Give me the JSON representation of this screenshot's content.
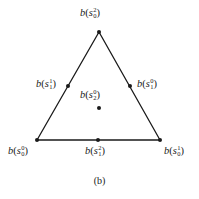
{
  "figure": {
    "caption": "(b)",
    "edge_color": "#1a1a1a",
    "vertices": {
      "top": {
        "x": 99,
        "y": 32
      },
      "bottom_left": {
        "x": 37,
        "y": 140
      },
      "bottom_right": {
        "x": 160,
        "y": 140
      }
    },
    "points": [
      {
        "id": "s0_2",
        "x": 99,
        "y": 32,
        "func": "b",
        "var": "s",
        "sup": "2",
        "sub": "0",
        "label_x": 80,
        "label_y": 8
      },
      {
        "id": "s1_1",
        "x": 68,
        "y": 86,
        "func": "b",
        "var": "s",
        "sup": "1",
        "sub": "1",
        "label_x": 36,
        "label_y": 79
      },
      {
        "id": "s1_0",
        "x": 130,
        "y": 86,
        "func": "b",
        "var": "s",
        "sup": "0",
        "sub": "1",
        "label_x": 137,
        "label_y": 79
      },
      {
        "id": "s2_0",
        "x": 99,
        "y": 108,
        "func": "b",
        "var": "s",
        "sup": "0",
        "sub": "2",
        "label_x": 80,
        "label_y": 90
      },
      {
        "id": "s0_0",
        "x": 37,
        "y": 140,
        "func": "b",
        "var": "s",
        "sup": "0",
        "sub": "0",
        "label_x": 8,
        "label_y": 146
      },
      {
        "id": "s1_2",
        "x": 98,
        "y": 140,
        "func": "b",
        "var": "s",
        "sup": "2",
        "sub": "1",
        "label_x": 85,
        "label_y": 146
      },
      {
        "id": "s0_1",
        "x": 160,
        "y": 140,
        "func": "b",
        "var": "s",
        "sup": "1",
        "sub": "0",
        "label_x": 164,
        "label_y": 146
      }
    ]
  }
}
